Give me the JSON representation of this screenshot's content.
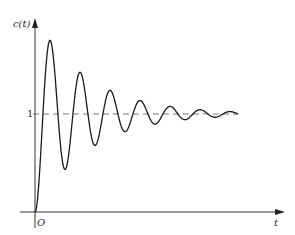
{
  "chart_data": {
    "type": "line",
    "title": "",
    "xlabel": "t",
    "ylabel": "c(t)",
    "origin_label": "O",
    "y_ticks": [
      "1"
    ],
    "grid": false,
    "legend": null,
    "annotations": [
      "dashed steady-state reference line at c(t)=1"
    ],
    "ylim": [
      0,
      1.9
    ],
    "xlim": [
      0,
      10
    ],
    "series": [
      {
        "name": "c(t)",
        "x": [
          0,
          0.35,
          0.7,
          1.05,
          1.4,
          1.75,
          2.1,
          2.45,
          2.8,
          3.15,
          3.5,
          3.85,
          4.2,
          4.55,
          4.9,
          5.25,
          5.6,
          6.0,
          7.0,
          8.0
        ],
        "values": [
          0,
          1.0,
          1.82,
          1.0,
          0.55,
          1.0,
          1.32,
          1.0,
          0.8,
          1.0,
          1.09,
          1.0,
          0.97,
          1.0,
          1.05,
          1.0,
          0.99,
          1.02,
          1.0,
          1.0
        ]
      }
    ],
    "reference_line": {
      "y": 1,
      "style": "dashed"
    }
  },
  "labels": {
    "y_axis": "c(t)",
    "x_axis": "t",
    "origin": "O",
    "one": "1"
  }
}
